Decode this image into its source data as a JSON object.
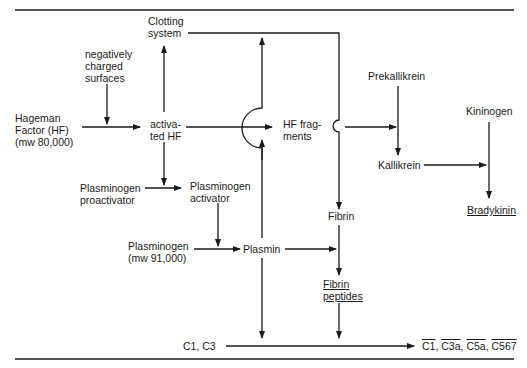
{
  "nodes": {
    "clotting_system": [
      "Clotting",
      "system"
    ],
    "negatively_charged_surfaces": [
      "negatively",
      "charged",
      "surfaces"
    ],
    "hageman_factor": [
      "Hageman",
      "Factor (HF)",
      "(mw 80,000)"
    ],
    "activated_hf": [
      "activa-",
      "ted HF"
    ],
    "hf_fragments": [
      "HF frag-",
      "ments"
    ],
    "prekallikrein": "Prekallikrein",
    "kallikrein": "Kallikrein",
    "kininogen": "Kininogen",
    "bradykinin": "Bradykinin",
    "plasminogen_proactivator": [
      "Plasminogen",
      "proactivator"
    ],
    "plasminogen_activator": [
      "Plasminogen",
      "activator"
    ],
    "plasminogen": [
      "Plasminogen",
      "(mw 91,000)"
    ],
    "plasmin": "Plasmin",
    "fibrin": "Fibrin",
    "fibrin_peptides": [
      "Fibrin",
      "peptides"
    ],
    "c1_c3": "C1, C3",
    "complement_products": [
      "C1",
      "C3a",
      "C5a",
      "C567"
    ],
    "complement_separator": ", "
  },
  "edges": [
    {
      "from": "negatively charged surfaces",
      "to": "Hageman Factor → activated HF"
    },
    {
      "from": "Hageman Factor (HF)",
      "to": "activated HF"
    },
    {
      "from": "activated HF",
      "to": "Clotting system"
    },
    {
      "from": "activated HF",
      "to": "HF fragments"
    },
    {
      "from": "activated HF",
      "to": "Plasminogen proactivator → activator"
    },
    {
      "from": "Plasminogen proactivator",
      "to": "Plasminogen activator"
    },
    {
      "from": "Plasminogen activator",
      "to": "Plasminogen → Plasmin"
    },
    {
      "from": "Plasminogen",
      "to": "Plasmin"
    },
    {
      "from": "Plasmin",
      "to": "Clotting system"
    },
    {
      "from": "Plasmin",
      "to": "C1, C3 → complement"
    },
    {
      "from": "Plasmin",
      "to": "Fibrin → Fibrin peptides"
    },
    {
      "from": "Clotting system",
      "to": "Fibrin"
    },
    {
      "from": "Fibrin",
      "to": "Fibrin peptides"
    },
    {
      "from": "Fibrin peptides",
      "to": "C1, C3 → complement"
    },
    {
      "from": "HF fragments",
      "to": "Prekallikrein → Kallikrein"
    },
    {
      "from": "Prekallikrein",
      "to": "Kallikrein"
    },
    {
      "from": "Kallikrein",
      "to": "Kininogen → Bradykinin"
    },
    {
      "from": "Kininogen",
      "to": "Bradykinin"
    },
    {
      "from": "C1, C3",
      "to": "C1, C3a, C5a, C567"
    }
  ]
}
